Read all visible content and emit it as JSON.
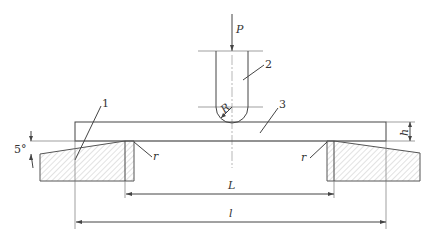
{
  "diagram": {
    "type": "three-point bending test setup",
    "labels": {
      "load": "P",
      "punch_radius": "R",
      "support_radius_left": "r",
      "support_radius_right": "r",
      "thickness": "h",
      "span": "L",
      "length": "l",
      "angle": "5°",
      "part_1": "1",
      "part_2": "2",
      "part_3": "3"
    },
    "colors": {
      "line": "#444444",
      "hatch": "#999999",
      "background": "#ffffff"
    }
  }
}
